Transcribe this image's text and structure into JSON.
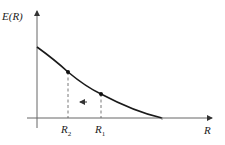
{
  "diagram": {
    "type": "energy-curve",
    "y_axis_label": "E(R)",
    "x_axis_label": "R",
    "points": [
      {
        "name": "R1",
        "label_main": "R",
        "label_sub": "1"
      },
      {
        "name": "R2",
        "label_main": "R",
        "label_sub": "2"
      }
    ],
    "arrow_direction": "left"
  },
  "colors": {
    "curve": "#1a1a1a",
    "axis": "#555555",
    "background": "#ffffff"
  }
}
